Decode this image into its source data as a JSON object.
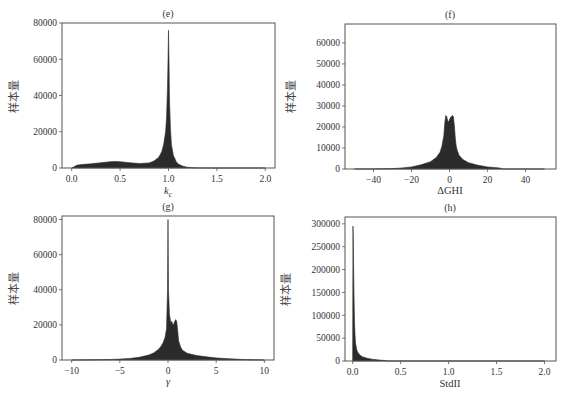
{
  "figure": {
    "ylabel_common": "样本量"
  },
  "chart_data": [
    {
      "id": "e",
      "type": "area",
      "title": "(e)",
      "xlabel": "k_c",
      "xlabel_main": "k",
      "xlabel_sub": "c",
      "ylabel": "样本量",
      "xlim": [
        -0.1,
        2.1
      ],
      "ylim": [
        0,
        80000
      ],
      "xticks": [
        0.0,
        0.5,
        1.0,
        1.5,
        2.0
      ],
      "xtick_labels": [
        "0.0",
        "0.5",
        "1.0",
        "1.5",
        "2.0"
      ],
      "yticks": [
        0,
        20000,
        40000,
        60000,
        80000
      ],
      "ytick_labels": [
        "0",
        "20000",
        "40000",
        "60000",
        "80000"
      ],
      "grid": false,
      "fill_color": "#2b2b2b",
      "x": [
        0.0,
        0.02,
        0.05,
        0.1,
        0.2,
        0.3,
        0.4,
        0.45,
        0.5,
        0.6,
        0.7,
        0.8,
        0.85,
        0.9,
        0.93,
        0.95,
        0.97,
        0.98,
        0.99,
        0.995,
        1.0,
        1.005,
        1.01,
        1.02,
        1.03,
        1.05,
        1.08,
        1.1,
        1.15,
        1.2,
        1.25,
        1.3,
        1.5,
        2.0
      ],
      "values": [
        0,
        500,
        1500,
        1900,
        2300,
        2900,
        3500,
        3600,
        3500,
        2900,
        2500,
        2800,
        3800,
        6000,
        9000,
        13000,
        20000,
        28000,
        45000,
        60000,
        76000,
        60000,
        38000,
        22000,
        13000,
        7000,
        3500,
        2200,
        900,
        400,
        150,
        50,
        0,
        0
      ]
    },
    {
      "id": "f",
      "type": "area",
      "title": "(f)",
      "xlabel": "ΔGHI",
      "ylabel": "样本量",
      "xlim": [
        -55,
        56
      ],
      "ylim": [
        0,
        69000
      ],
      "xticks": [
        -40,
        -20,
        0,
        20,
        40
      ],
      "xtick_labels": [
        "−40",
        "−20",
        "0",
        "20",
        "40"
      ],
      "yticks": [
        0,
        10000,
        20000,
        30000,
        40000,
        50000,
        60000
      ],
      "ytick_labels": [
        "0",
        "10000",
        "20000",
        "30000",
        "40000",
        "50000",
        "60000"
      ],
      "grid": false,
      "fill_color": "#2b2b2b",
      "x": [
        -50,
        -40,
        -30,
        -25,
        -20,
        -15,
        -10,
        -7,
        -5,
        -4,
        -3,
        -2.5,
        -2,
        -1.5,
        -1,
        -0.5,
        0,
        0.5,
        1,
        1.5,
        2,
        2.5,
        3,
        3.5,
        4,
        5,
        7,
        10,
        15,
        20,
        25,
        27,
        28,
        30,
        50
      ],
      "values": [
        0,
        50,
        200,
        500,
        1000,
        2000,
        3500,
        5500,
        8000,
        11000,
        16000,
        22000,
        25500,
        25000,
        23000,
        22500,
        23500,
        24500,
        25000,
        25500,
        25000,
        21000,
        15000,
        11000,
        9000,
        6500,
        4500,
        3000,
        1800,
        1000,
        600,
        400,
        0,
        0,
        0
      ]
    },
    {
      "id": "g",
      "type": "area",
      "title": "(g)",
      "xlabel": "γ",
      "ylabel": "样本量",
      "xlim": [
        -11,
        11
      ],
      "ylim": [
        0,
        82000
      ],
      "xticks": [
        -10,
        -5,
        0,
        5,
        10
      ],
      "xtick_labels": [
        "−10",
        "−5",
        "0",
        "5",
        "10"
      ],
      "yticks": [
        0,
        20000,
        40000,
        60000,
        80000
      ],
      "ytick_labels": [
        "0",
        "20000",
        "40000",
        "60000",
        "80000"
      ],
      "grid": false,
      "fill_color": "#2b2b2b",
      "x": [
        -10,
        -8,
        -6,
        -5,
        -4,
        -3,
        -2,
        -1.5,
        -1,
        -0.7,
        -0.5,
        -0.3,
        -0.15,
        -0.05,
        0,
        0.05,
        0.15,
        0.3,
        0.4,
        0.5,
        0.6,
        0.7,
        0.8,
        0.9,
        1.0,
        1.1,
        1.3,
        1.5,
        2,
        3,
        4,
        5,
        6,
        7,
        8,
        9,
        10
      ],
      "values": [
        0,
        100,
        300,
        500,
        900,
        1500,
        2800,
        4000,
        6000,
        8000,
        10000,
        13000,
        18000,
        40000,
        80000,
        40000,
        26000,
        21000,
        22000,
        20000,
        20500,
        22000,
        23000,
        22000,
        17000,
        11000,
        7500,
        5500,
        3800,
        2500,
        1800,
        1200,
        800,
        500,
        250,
        100,
        0
      ]
    },
    {
      "id": "h",
      "type": "area",
      "title": "(h)",
      "xlabel": "StdII",
      "ylabel": "样本量",
      "xlim": [
        -0.08,
        2.12
      ],
      "ylim": [
        0,
        315000
      ],
      "xticks": [
        0.0,
        0.5,
        1.0,
        1.5,
        2.0
      ],
      "xtick_labels": [
        "0.0",
        "0.5",
        "1.0",
        "1.5",
        "2.0"
      ],
      "yticks": [
        0,
        50000,
        100000,
        150000,
        200000,
        250000,
        300000
      ],
      "ytick_labels": [
        "0",
        "50000",
        "100000",
        "150000",
        "200000",
        "250000",
        "300000"
      ],
      "grid": false,
      "fill_color": "#2b2b2b",
      "x": [
        0.0,
        0.003,
        0.006,
        0.01,
        0.015,
        0.02,
        0.025,
        0.03,
        0.04,
        0.05,
        0.07,
        0.1,
        0.15,
        0.2,
        0.25,
        0.3,
        0.35,
        0.36,
        2.0
      ],
      "values": [
        0,
        295000,
        270000,
        200000,
        130000,
        80000,
        55000,
        40000,
        27000,
        20000,
        14000,
        9500,
        6000,
        4000,
        2800,
        1800,
        1000,
        0,
        0
      ]
    }
  ],
  "panels_layout": {
    "e": {
      "left": 62,
      "right": 275,
      "top": 23,
      "bottom": 168
    },
    "f": {
      "left": 345,
      "right": 556,
      "top": 24,
      "bottom": 169
    },
    "g": {
      "left": 62,
      "right": 274,
      "top": 216,
      "bottom": 360
    },
    "h": {
      "left": 345,
      "right": 556,
      "top": 217,
      "bottom": 361
    }
  }
}
